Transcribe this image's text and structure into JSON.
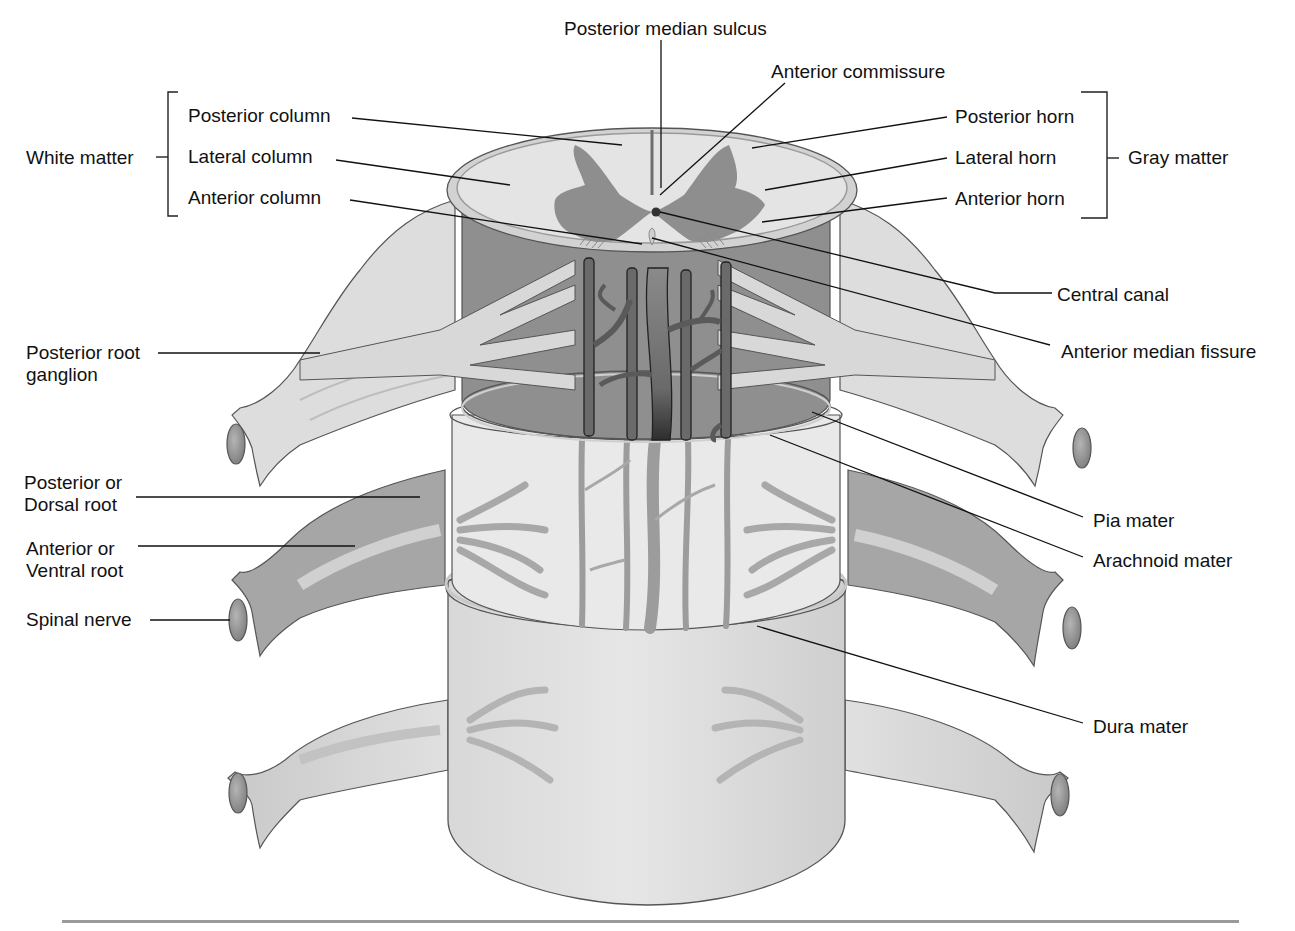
{
  "figure": {
    "colors": {
      "white_matter": "#e4e4e4",
      "gray_matter": "#8e8e8e",
      "cord_dark": "#8f8f8f",
      "nerve_light": "#dcdcdc",
      "nerve_dark": "#a3a3a3",
      "dura": "#e2e2e2",
      "vessel": "#5e5e5e",
      "outline": "#555555",
      "leader": "#111111",
      "rule": "#9a9a9a"
    },
    "groups": {
      "white_matter": {
        "label": "White matter",
        "items": [
          "Posterior column",
          "Lateral column",
          "Anterior column"
        ]
      },
      "gray_matter": {
        "label": "Gray matter",
        "items": [
          "Posterior horn",
          "Lateral horn",
          "Anterior horn"
        ]
      }
    },
    "labels": {
      "posterior_median_sulcus": "Posterior median sulcus",
      "anterior_commissure": "Anterior commissure",
      "posterior_column": "Posterior column",
      "lateral_column": "Lateral column",
      "anterior_column": "Anterior column",
      "white_matter": "White matter",
      "posterior_horn": "Posterior horn",
      "lateral_horn": "Lateral horn",
      "anterior_horn": "Anterior horn",
      "gray_matter": "Gray matter",
      "central_canal": "Central canal",
      "anterior_median_fissure": "Anterior median fissure",
      "posterior_root_ganglion": "Posterior root ganglion",
      "posterior_root": "Posterior or Dorsal root",
      "anterior_root": "Anterior or Ventral root",
      "spinal_nerve": "Spinal nerve",
      "pia_mater": "Pia mater",
      "arachnoid_mater": "Arachnoid mater",
      "dura_mater": "Dura mater"
    }
  }
}
